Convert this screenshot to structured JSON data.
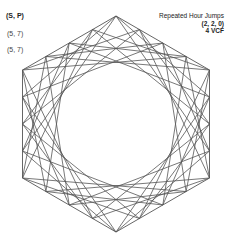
{
  "labels": {
    "primary": "(S, P)",
    "secondary_1": "(5, 7)",
    "secondary_2": "(5, 7)"
  },
  "title": {
    "line1": "Repeated Hour Jumps",
    "line2": "(2, 2, 0)",
    "line3": "4 VCF"
  },
  "figure": {
    "shape": "hexagon",
    "center": [
      116,
      124
    ],
    "radius": 108,
    "points_per_edge": 4,
    "jump": 5,
    "stroke": "#555555"
  }
}
